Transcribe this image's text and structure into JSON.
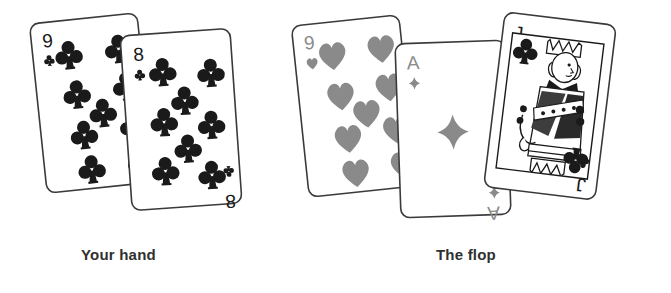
{
  "scene": {
    "title": "Poker hand illustration",
    "background_color": "#ffffff",
    "ink_color": "#1a1a1a",
    "red_suit_render_color": "#8a8a8a",
    "black_suit_render_color": "#1a1a1a",
    "card_face_color": "#ffffff",
    "card_border_color": "#3a3a3a"
  },
  "labels": {
    "hand": "Your hand",
    "flop": "The flop"
  },
  "groups": [
    {
      "name": "your-hand",
      "label": "Your hand",
      "cards": [
        {
          "rank": "9",
          "suit": "clubs",
          "suit_symbol": "♣",
          "color": "black",
          "color_hex": "#1a1a1a",
          "index_top": "9",
          "index_bottom": "9",
          "pip_count": 9,
          "rotation_deg": -6,
          "x": 38,
          "y": 18,
          "width": 108,
          "height": 170,
          "z": 1
        },
        {
          "rank": "8",
          "suit": "clubs",
          "suit_symbol": "♣",
          "color": "black",
          "color_hex": "#1a1a1a",
          "index_top": "8",
          "index_bottom": "8",
          "pip_count": 8,
          "rotation_deg": -4,
          "x": 126,
          "y": 32,
          "width": 110,
          "height": 175,
          "z": 2
        }
      ]
    },
    {
      "name": "the-flop",
      "label": "The flop",
      "cards": [
        {
          "rank": "9",
          "suit": "hearts",
          "suit_symbol": "♥",
          "color": "red",
          "color_hex": "#8a8a8a",
          "index_top": "9",
          "index_bottom": "9",
          "pip_count": 9,
          "rotation_deg": -6,
          "x": 300,
          "y": 20,
          "width": 108,
          "height": 172,
          "z": 1
        },
        {
          "rank": "A",
          "suit": "diamonds",
          "suit_symbol": "♦",
          "color": "red",
          "color_hex": "#8a8a8a",
          "index_top": "A",
          "index_bottom": "A",
          "pip_count": 1,
          "rotation_deg": -2,
          "x": 398,
          "y": 42,
          "width": 110,
          "height": 174,
          "z": 2
        },
        {
          "rank": "J",
          "suit": "clubs",
          "suit_symbol": "♣",
          "color": "black",
          "color_hex": "#1a1a1a",
          "index_top": "J",
          "index_bottom": "J",
          "pip_count": 0,
          "is_court_card": true,
          "court_figure": "jack-of-clubs-portrait",
          "rotation_deg": 7,
          "x": 494,
          "y": 18,
          "width": 112,
          "height": 176,
          "z": 3
        }
      ]
    }
  ]
}
